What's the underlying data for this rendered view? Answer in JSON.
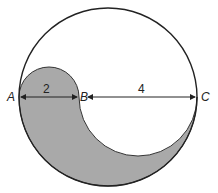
{
  "diagram": {
    "points": [
      {
        "id": "A",
        "label": "A"
      },
      {
        "id": "B",
        "label": "B"
      },
      {
        "id": "C",
        "label": "C"
      }
    ],
    "measurements": {
      "AB": "2",
      "BC": "4"
    },
    "colors": {
      "shade": "#a9a9a9",
      "stroke": "#222222",
      "background": "#ffffff"
    }
  }
}
